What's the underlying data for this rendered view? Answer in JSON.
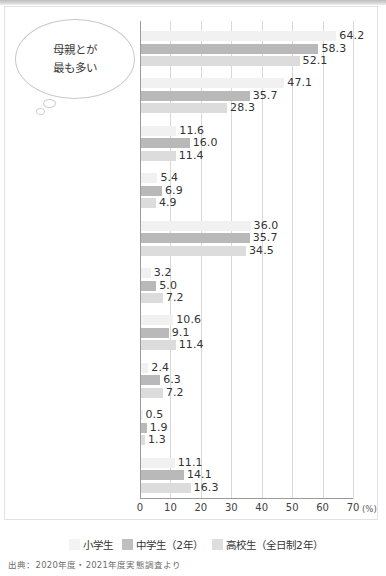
{
  "annotation": {
    "line1": "母親とが",
    "line2": "最も多い"
  },
  "source_note": "出典：2020年度・2021年度実態調査より",
  "chart_data": {
    "type": "bar",
    "orientation": "horizontal",
    "title": "",
    "xlabel": "(%)",
    "ylabel": "",
    "xlim": [
      0,
      70
    ],
    "xticks": [
      0,
      10,
      20,
      30,
      40,
      50,
      60,
      70
    ],
    "xtick_labels": [
      "0",
      "10",
      "20",
      "30",
      "40",
      "50",
      "60",
      "70"
    ],
    "unit_label": "(%)",
    "grid": true,
    "legend_position": "bottom",
    "categories": [
      "母親",
      "父親",
      "祖母",
      "祖父",
      "きょうだい",
      "親戚",
      "自分のみ",
      "福祉サービス\n（ヘルパーなど）を利用",
      "その他",
      "無回答"
    ],
    "category_lines": [
      [
        "母親"
      ],
      [
        "父親"
      ],
      [
        "祖母"
      ],
      [
        "祖父"
      ],
      [
        "きょうだい"
      ],
      [
        "親戚"
      ],
      [
        "自分のみ"
      ],
      [
        "福祉サービス",
        "（ヘルパーなど）を利用"
      ],
      [
        "その他"
      ],
      [
        "無回答"
      ]
    ],
    "series": [
      {
        "name": "小学生",
        "color": "#f1f1f1",
        "values": [
          64.2,
          47.1,
          11.6,
          5.4,
          36.0,
          3.2,
          10.6,
          2.4,
          0.5,
          11.1
        ]
      },
      {
        "name": "中学生（2年）",
        "color": "#b9b9b9",
        "values": [
          58.3,
          35.7,
          16.0,
          6.9,
          35.7,
          5.0,
          9.1,
          6.3,
          1.9,
          14.1
        ]
      },
      {
        "name": "高校生（全日制2年）",
        "color": "#dcdcdc",
        "values": [
          52.1,
          28.3,
          11.4,
          4.9,
          34.5,
          7.2,
          11.4,
          7.2,
          1.3,
          16.3
        ]
      }
    ]
  }
}
